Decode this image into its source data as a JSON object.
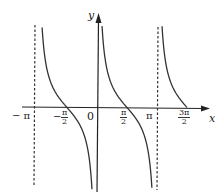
{
  "chart_data": {
    "type": "line",
    "title": "",
    "function": "y = cot x",
    "xlabel": "x",
    "ylabel": "y",
    "origin_label": "0",
    "x_tick_labels": [
      "−π",
      "−π/2",
      "π/2",
      "π",
      "3π/2"
    ],
    "x_ticks": [
      -3.1416,
      -1.5708,
      1.5708,
      3.1416,
      4.7124
    ],
    "xlim": [
      -3.8,
      5.8
    ],
    "asymptotes": [
      -3.1416,
      3.1416
    ],
    "asymptote_style": "dashed",
    "series": [
      {
        "name": "branch-1",
        "x_range": [
          -3.0,
          -0.1
        ],
        "zero_at": -1.5708
      },
      {
        "name": "branch-2",
        "x_range": [
          0.12,
          3.0
        ],
        "zero_at": 1.5708
      },
      {
        "name": "branch-3",
        "x_range": [
          3.3,
          4.7124
        ],
        "zero_at": 4.7124
      }
    ],
    "grid": false,
    "legend": null
  },
  "labels": {
    "y": "y",
    "x": "x",
    "origin": "0",
    "neg_pi": "− π",
    "neg_half_pi_num": "π",
    "neg_half_pi_den": "2",
    "neg_sign": "−",
    "half_pi_num": "π",
    "half_pi_den": "2",
    "pi": "π",
    "three_half_pi_num": "3π",
    "three_half_pi_den": "2"
  },
  "colors": {
    "curve": "#333333",
    "axis": "#222222",
    "asymptote": "#333333"
  }
}
